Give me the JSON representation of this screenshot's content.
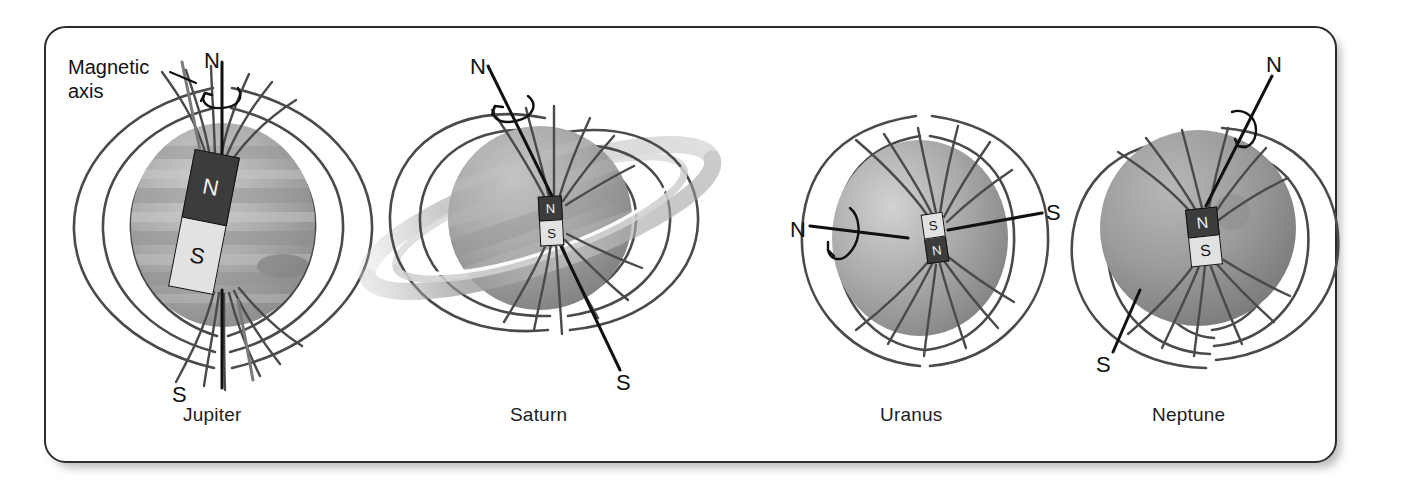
{
  "figure": {
    "background": "#ffffff",
    "frame_color": "#2b2b2b",
    "annotation": {
      "line1": "Magnetic",
      "line2": "axis"
    }
  },
  "planets": [
    {
      "id": "jupiter",
      "caption": "Jupiter",
      "rotation_axis": {
        "north_label": "N",
        "south_label": "S"
      },
      "magnet": {
        "north": "N",
        "south": "S"
      },
      "sphere_style": "banded",
      "has_rings": false
    },
    {
      "id": "saturn",
      "caption": "Saturn",
      "rotation_axis": {
        "north_label": "N",
        "south_label": "S"
      },
      "magnet": {
        "north": "N",
        "south": "S"
      },
      "sphere_style": "banded",
      "has_rings": true
    },
    {
      "id": "uranus",
      "caption": "Uranus",
      "rotation_axis": {
        "north_label": "N",
        "south_label": "S"
      },
      "magnet": {
        "north": "N",
        "south": "S"
      },
      "sphere_style": "smooth",
      "has_rings": false
    },
    {
      "id": "neptune",
      "caption": "Neptune",
      "rotation_axis": {
        "north_label": "N",
        "south_label": "S"
      },
      "magnet": {
        "north": "N",
        "south": "S"
      },
      "sphere_style": "smooth",
      "has_rings": false
    }
  ],
  "colors": {
    "field_line": "#4a4a4a",
    "axis_line": "#111111",
    "magnetic_axis_line": "#6f6f6f",
    "magnet_north": "#3c3c3c",
    "magnet_south": "#e2e2e2",
    "text": "#1d1d1d"
  }
}
